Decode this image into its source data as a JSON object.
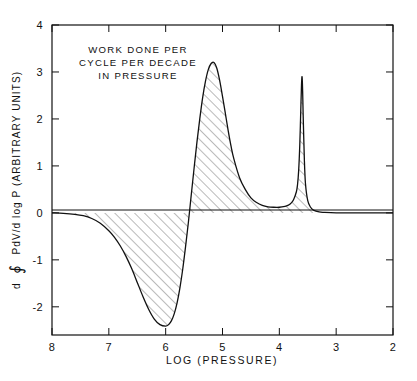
{
  "figure": {
    "background_color": "#ffffff",
    "line_color": "#111111",
    "hatch_color": "#333333"
  },
  "annotation": {
    "line1": "WORK DONE PER",
    "line2": "CYCLE PER DECADE",
    "line3": "IN PRESSURE"
  },
  "yaxis_label": {
    "prefix": "d",
    "symbol": "∮",
    "suffix": "PdV/d log P  (ARBITRARY UNITS)",
    "full": "d ∮ PdV/d log P (ARBITRARY UNITS)"
  },
  "xaxis_label": "LOG (PRESSURE)",
  "chart_data": {
    "type": "area",
    "title": "",
    "subtitle": "",
    "annotation": "WORK DONE PER CYCLE PER DECADE IN PRESSURE",
    "xlabel": "LOG (PRESSURE)",
    "ylabel": "d ∮ PdV/d log P (ARBITRARY UNITS)",
    "xlim": [
      8,
      2
    ],
    "ylim": [
      -2.6,
      4
    ],
    "x_inverted": true,
    "grid": false,
    "legend": null,
    "xticks": [
      8,
      7,
      6,
      5,
      4,
      3,
      2
    ],
    "xtick_labels": [
      "8",
      "7",
      "6",
      "5",
      "4",
      "3",
      "2"
    ],
    "yticks": [
      -2,
      -1,
      0,
      1,
      2,
      3,
      4
    ],
    "ytick_labels": [
      "-2",
      "-1",
      "0",
      "1",
      "2",
      "3",
      "4"
    ],
    "fill": "hatched",
    "baseline": 0,
    "series": [
      {
        "name": "work per decade",
        "x": [
          8.0,
          7.8,
          7.6,
          7.45,
          7.3,
          7.15,
          7.0,
          6.9,
          6.8,
          6.7,
          6.6,
          6.5,
          6.4,
          6.3,
          6.2,
          6.1,
          6.0,
          5.95,
          5.9,
          5.85,
          5.8,
          5.75,
          5.7,
          5.65,
          5.6,
          5.55,
          5.5,
          5.45,
          5.4,
          5.35,
          5.3,
          5.25,
          5.2,
          5.15,
          5.1,
          5.05,
          5.0,
          4.95,
          4.9,
          4.85,
          4.8,
          4.7,
          4.6,
          4.5,
          4.4,
          4.3,
          4.2,
          4.1,
          4.0,
          3.9,
          3.85,
          3.8,
          3.75,
          3.7,
          3.68,
          3.66,
          3.64,
          3.62,
          3.61,
          3.6,
          3.59,
          3.58,
          3.56,
          3.54,
          3.5,
          3.45,
          3.4,
          3.3,
          3.2,
          3.0,
          2.8,
          2.5,
          2.2,
          2.0
        ],
        "y": [
          0.0,
          -0.01,
          -0.03,
          -0.06,
          -0.12,
          -0.22,
          -0.38,
          -0.52,
          -0.7,
          -0.92,
          -1.18,
          -1.48,
          -1.78,
          -2.05,
          -2.26,
          -2.38,
          -2.41,
          -2.38,
          -2.3,
          -2.15,
          -1.92,
          -1.6,
          -1.2,
          -0.72,
          -0.2,
          0.38,
          0.95,
          1.5,
          2.0,
          2.45,
          2.8,
          3.05,
          3.18,
          3.2,
          3.08,
          2.82,
          2.48,
          2.12,
          1.75,
          1.42,
          1.15,
          0.75,
          0.5,
          0.32,
          0.22,
          0.16,
          0.13,
          0.12,
          0.12,
          0.14,
          0.16,
          0.2,
          0.28,
          0.45,
          0.6,
          0.9,
          1.45,
          2.3,
          2.72,
          2.9,
          2.6,
          2.05,
          1.15,
          0.62,
          0.26,
          0.12,
          0.06,
          0.02,
          0.01,
          0.0,
          0.0,
          0.0,
          0.0,
          0.0
        ]
      }
    ],
    "features": {
      "negative_trough_min": -2.41,
      "negative_trough_at_x": 6.0,
      "zero_crossing": 5.58,
      "main_peak_value": 3.2,
      "main_peak_at_x": 5.15,
      "plateau_value": 0.12,
      "spike_peak_value": 2.9,
      "spike_peak_at_x": 3.6
    }
  }
}
